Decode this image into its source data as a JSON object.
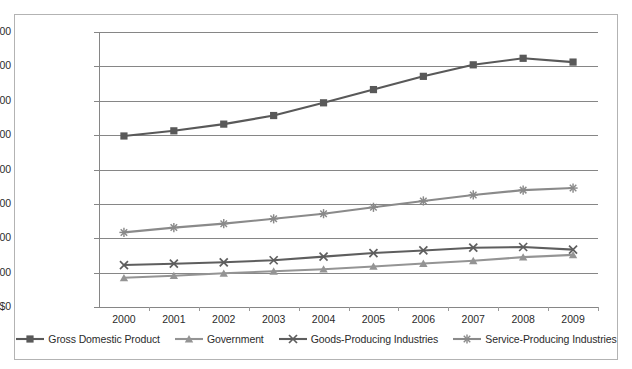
{
  "chart_data": {
    "type": "line",
    "title": "",
    "xlabel": "",
    "ylabel": "",
    "categories": [
      "2000",
      "2001",
      "2002",
      "2003",
      "2004",
      "2005",
      "2006",
      "2007",
      "2008",
      "2009"
    ],
    "ylim": [
      0,
      16000
    ],
    "ytick_values": [
      0,
      2000,
      4000,
      6000,
      8000,
      10000,
      12000,
      14000,
      16000
    ],
    "ytick_labels": [
      "$0",
      "$2,000",
      "$4,000",
      "$6,000",
      "$8,000",
      "$10,000",
      "$12,000",
      "$14,000",
      "$16,000"
    ],
    "grid": true,
    "legend_position": "bottom",
    "series": [
      {
        "name": "Gross Domestic Product",
        "marker": "square",
        "color": "#595959",
        "values": [
          9950,
          10250,
          10640,
          11140,
          11880,
          12650,
          13420,
          14090,
          14470,
          14250
        ]
      },
      {
        "name": "Government",
        "marker": "triangle",
        "color": "#949494",
        "values": [
          1700,
          1820,
          1960,
          2080,
          2200,
          2360,
          2530,
          2690,
          2900,
          3030
        ]
      },
      {
        "name": "Goods-Producing Industries",
        "marker": "x",
        "color": "#5e5e5e",
        "values": [
          2440,
          2520,
          2600,
          2720,
          2930,
          3140,
          3290,
          3450,
          3490,
          3340
        ]
      },
      {
        "name": "Service-Producing Industries",
        "marker": "asterisk",
        "color": "#8a8a8a",
        "values": [
          4340,
          4620,
          4850,
          5130,
          5430,
          5800,
          6170,
          6520,
          6800,
          6920
        ]
      }
    ]
  },
  "axes": {
    "gridline_color": "#868686",
    "axis_color": "#868686",
    "border_color": "#b3b3b3"
  },
  "legend": {
    "items": [
      {
        "label": "Gross Domestic Product"
      },
      {
        "label": "Government"
      },
      {
        "label": "Goods-Producing Industries"
      },
      {
        "label": "Service-Producing Industries"
      }
    ]
  }
}
